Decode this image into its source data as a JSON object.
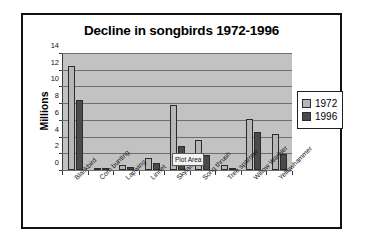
{
  "frame": {
    "name": "chart-frame"
  },
  "tooltip": {
    "label": "Plot Area"
  },
  "legend": {
    "position": "right",
    "items": [
      {
        "label": "1972",
        "color": "#b6b6b6"
      },
      {
        "label": "1996",
        "color": "#4a4a4a"
      }
    ]
  },
  "chart_data": {
    "type": "bar",
    "title": "Decline in songbirds 1972-1996",
    "xlabel": "",
    "ylabel": "Millions",
    "ylim": [
      0,
      14
    ],
    "yticks": [
      0,
      2,
      4,
      6,
      8,
      10,
      12,
      14
    ],
    "ytick_labels": [
      "0",
      "2",
      "4",
      "6",
      "8",
      "10",
      "12",
      "14"
    ],
    "grid": true,
    "legend_position": "right",
    "categories": [
      "Blackbird",
      "Corn bunting",
      "Lapwing",
      "Linnet",
      "Skylark",
      "Song thrush",
      "Tree sparrow",
      "Willow Warbler",
      "Yellowhammer"
    ],
    "series": [
      {
        "name": "1972",
        "color": "#b6b6b6",
        "values": [
          12.5,
          0.15,
          0.65,
          1.5,
          7.8,
          3.6,
          0.6,
          6.1,
          4.3
        ]
      },
      {
        "name": "1996",
        "color": "#4a4a4a",
        "values": [
          8.5,
          0.1,
          0.35,
          0.9,
          2.9,
          1.8,
          0.05,
          4.6,
          1.9
        ]
      }
    ]
  }
}
